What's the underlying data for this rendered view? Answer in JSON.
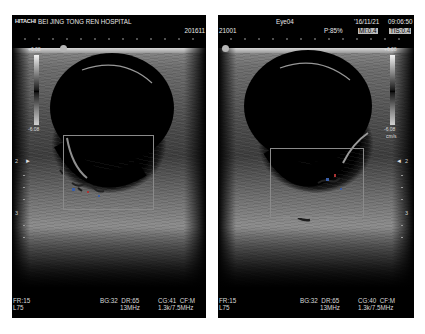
{
  "left_panel": {
    "brand": "HITACHI",
    "hospital": "BEI JING TONG REN HOSPITAL",
    "id_part": "201611",
    "colorbar_top": "+6.08",
    "colorbar_bottom": "-6.08",
    "depth_marks": [
      "2",
      "3"
    ],
    "footer": {
      "fr": "FR:15",
      "probe": "L75",
      "bg": "BG:32",
      "dr": "DR:65",
      "cg": "CG:41",
      "cf": "CF:M",
      "freq": "13MHz",
      "prf": "1.3k/7.5MHz"
    }
  },
  "right_panel": {
    "id_part": "21001",
    "exam": "Eye04",
    "date": "'16/11/21",
    "time": "09:06:50",
    "power": "P:85%",
    "mi": "MI:0.4",
    "tis": "TIS:0.4",
    "colorbar_top": "+6.08",
    "colorbar_bottom": "-6.08",
    "colorbar_unit": "cm/s",
    "depth_marks": [
      "2",
      "3"
    ],
    "footer": {
      "fr": "FR:15",
      "probe": "L75",
      "bg": "BG:32",
      "dr": "DR:65",
      "cg": "CG:40",
      "cf": "CF:M",
      "freq": "13MHz",
      "prf": "1.3k/7.5MHz"
    }
  },
  "colors": {
    "background": "#ffffff",
    "panel": "#000000",
    "text": "#e8e8e8",
    "badge": "#bdbdbd",
    "roi_box": "#8a8a8a"
  }
}
